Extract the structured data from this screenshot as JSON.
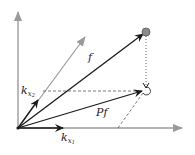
{
  "diagram": {
    "title": "",
    "colors": {
      "axis": "#9a9a9a",
      "vector": "#1a1a1a",
      "guide": "#555555",
      "point_fill": "#8c8c8c",
      "background": "#ffffff"
    },
    "origin": {
      "x": 18,
      "y": 128
    },
    "axes": [
      {
        "id": "y-axis",
        "from": [
          18,
          128
        ],
        "to": [
          18,
          12
        ],
        "color": "#9a9a9a"
      },
      {
        "id": "x-axis",
        "from": [
          18,
          128
        ],
        "to": [
          182,
          128
        ],
        "color": "#9a9a9a"
      },
      {
        "id": "skew-axis",
        "from": [
          18,
          128
        ],
        "to": [
          85,
          37
        ],
        "color": "#9a9a9a"
      }
    ],
    "vectors": [
      {
        "id": "k-x2",
        "from": [
          18,
          128
        ],
        "to": [
          38,
          100
        ],
        "label": "k",
        "sub": "x",
        "subsub": "2"
      },
      {
        "id": "k-x1",
        "from": [
          18,
          128
        ],
        "to": [
          63,
          128
        ],
        "label": "k",
        "sub": "x",
        "subsub": "1"
      },
      {
        "id": "f",
        "from": [
          18,
          128
        ],
        "to": [
          144,
          33
        ],
        "label": "f"
      },
      {
        "id": "Pf",
        "from": [
          18,
          128
        ],
        "to": [
          143,
          91
        ],
        "label": "Pf"
      }
    ],
    "guides": [
      {
        "id": "horizontal-dashed",
        "from": [
          43,
          91
        ],
        "to": [
          142,
          91
        ],
        "style": "dashed"
      },
      {
        "id": "vertical-dotted",
        "from": [
          146,
          36
        ],
        "to": [
          146,
          88
        ],
        "style": "dotted"
      },
      {
        "id": "slant-dashed",
        "from": [
          118,
          128
        ],
        "to": [
          143,
          93
        ],
        "style": "dashed"
      }
    ],
    "points": [
      {
        "id": "f-point",
        "cx": 146,
        "cy": 32,
        "r": 4,
        "filled": true
      },
      {
        "id": "Pf-point",
        "cx": 147,
        "cy": 91,
        "r": 4,
        "filled": false
      }
    ],
    "labels": {
      "f": "f",
      "Pf": "Pf",
      "k_x2_main": "k",
      "k_x2_sub": "x",
      "k_x2_subsub": "2",
      "k_x1_main": "k",
      "k_x1_sub": "x",
      "k_x1_subsub": "1"
    }
  }
}
